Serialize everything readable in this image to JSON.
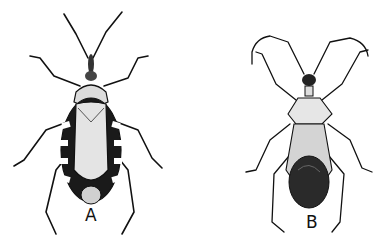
{
  "figure": {
    "panels": [
      {
        "id": "A",
        "label": "A",
        "subject": "insect-illustration-kissing-bug",
        "style": "black-and-white pen drawing, banded abdomen margins"
      },
      {
        "id": "B",
        "label": "B",
        "subject": "insect-illustration-assassin-bug",
        "style": "black-and-white pen drawing, dark abdomen, long curved antennae"
      }
    ],
    "colors": {
      "background": "#ffffff",
      "ink": "#111111",
      "shade": "#d8d8d8",
      "dark": "#2a2a2a"
    }
  }
}
